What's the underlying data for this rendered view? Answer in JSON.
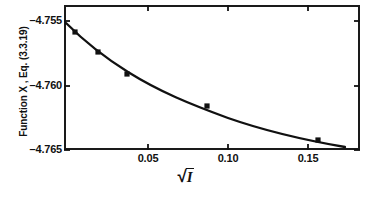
{
  "figure": {
    "background": "#ffffff",
    "ink": "#111111"
  },
  "axes": {
    "ylabel": "Function X , Eq. (3.3.19)",
    "xlabel_prefix": "",
    "xlabel_radicand": "I",
    "yticks": [
      "–4.755",
      "–4.760",
      "–4.765"
    ],
    "xticks": [
      "0.05",
      "0.10",
      "0.15"
    ]
  },
  "chart_data": {
    "type": "scatter",
    "title": "",
    "xlabel": "√I",
    "ylabel": "Function X, Eq. (3.3.19)",
    "xlim": [
      0.0,
      0.185
    ],
    "ylim": [
      -4.765,
      -4.755
    ],
    "ytick_values": [
      -4.755,
      -4.76,
      -4.765
    ],
    "xtick_values": [
      0.05,
      0.1,
      0.15
    ],
    "grid": false,
    "legend": null,
    "series": [
      {
        "name": "measured points",
        "marker": "filled-square",
        "x": [
          0.0115,
          0.0255,
          0.0395,
          0.0965,
          0.1595
        ],
        "y": [
          -4.7563,
          -4.7575,
          -4.7583,
          -4.7609,
          -4.7639
        ]
      },
      {
        "name": "fitted curve",
        "marker": "none",
        "x": [
          0.0,
          0.01,
          0.02,
          0.03,
          0.04,
          0.05,
          0.06,
          0.07,
          0.08,
          0.09,
          0.1,
          0.11,
          0.12,
          0.13,
          0.14,
          0.15,
          0.16,
          0.17
        ],
        "y": [
          -4.7553,
          -4.7562,
          -4.757,
          -4.7577,
          -4.7583,
          -4.7589,
          -4.7594,
          -4.7599,
          -4.7603,
          -4.7607,
          -4.7611,
          -4.7615,
          -4.7619,
          -4.7623,
          -4.7628,
          -4.7633,
          -4.7639,
          -4.7646
        ]
      }
    ]
  },
  "geometry": {
    "frame": {
      "left": 64,
      "top": 5,
      "right": 360,
      "bottom": 150
    },
    "y_positions": [
      21,
      86,
      150
    ],
    "x_positions": [
      148,
      228,
      308
    ],
    "points_px": [
      {
        "cx": 75,
        "cy": 32
      },
      {
        "cx": 98,
        "cy": 52
      },
      {
        "cx": 127,
        "cy": 74
      },
      {
        "cx": 207,
        "cy": 106
      },
      {
        "cx": 318,
        "cy": 140
      }
    ],
    "curve_path": "M 66,23 C 84,41 104,57 128,72 C 160,92 190,104 228,118 C 268,132 310,141 345,147",
    "tick_len": 6
  }
}
